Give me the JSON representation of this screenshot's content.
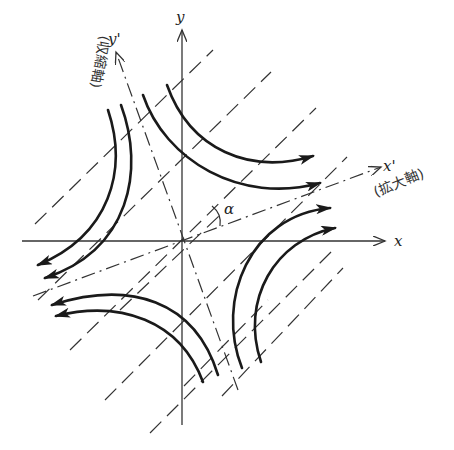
{
  "figure": {
    "axes": {
      "x_label": "x",
      "y_label": "y",
      "x_prime_label": "x'",
      "y_prime_label": "y'",
      "x_prime_caption": "(拡大軸)",
      "y_prime_caption": "(収縮軸)",
      "angle_label": "α"
    },
    "colors": {
      "ink": "#1a1a1a",
      "axis": "#333333",
      "background": "#ffffff"
    },
    "elements": {
      "flow_curves": 8,
      "dashed_parallel_lines": 8,
      "principal_axes": [
        "x'",
        "y'"
      ]
    }
  }
}
